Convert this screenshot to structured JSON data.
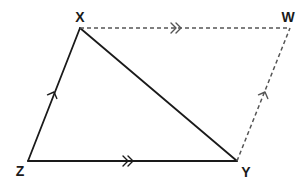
{
  "diagram": {
    "type": "parallelogram-with-diagonal",
    "colors": {
      "solid": "#1a1a1a",
      "dashed": "#555555",
      "background": "#ffffff"
    },
    "vertices": {
      "X": {
        "label": "X",
        "x": 80,
        "y": 28
      },
      "W": {
        "label": "W",
        "x": 290,
        "y": 28
      },
      "Y": {
        "label": "Y",
        "x": 237,
        "y": 161
      },
      "Z": {
        "label": "Z",
        "x": 28,
        "y": 161
      }
    },
    "edges": [
      {
        "from": "Z",
        "to": "X",
        "style": "solid",
        "marker": "single-arrow"
      },
      {
        "from": "X",
        "to": "Y",
        "style": "solid",
        "marker": "none"
      },
      {
        "from": "Z",
        "to": "Y",
        "style": "solid",
        "marker": "double-arrow"
      },
      {
        "from": "X",
        "to": "W",
        "style": "dashed",
        "marker": "double-arrow"
      },
      {
        "from": "Y",
        "to": "W",
        "style": "dashed",
        "marker": "single-arrow"
      }
    ]
  }
}
